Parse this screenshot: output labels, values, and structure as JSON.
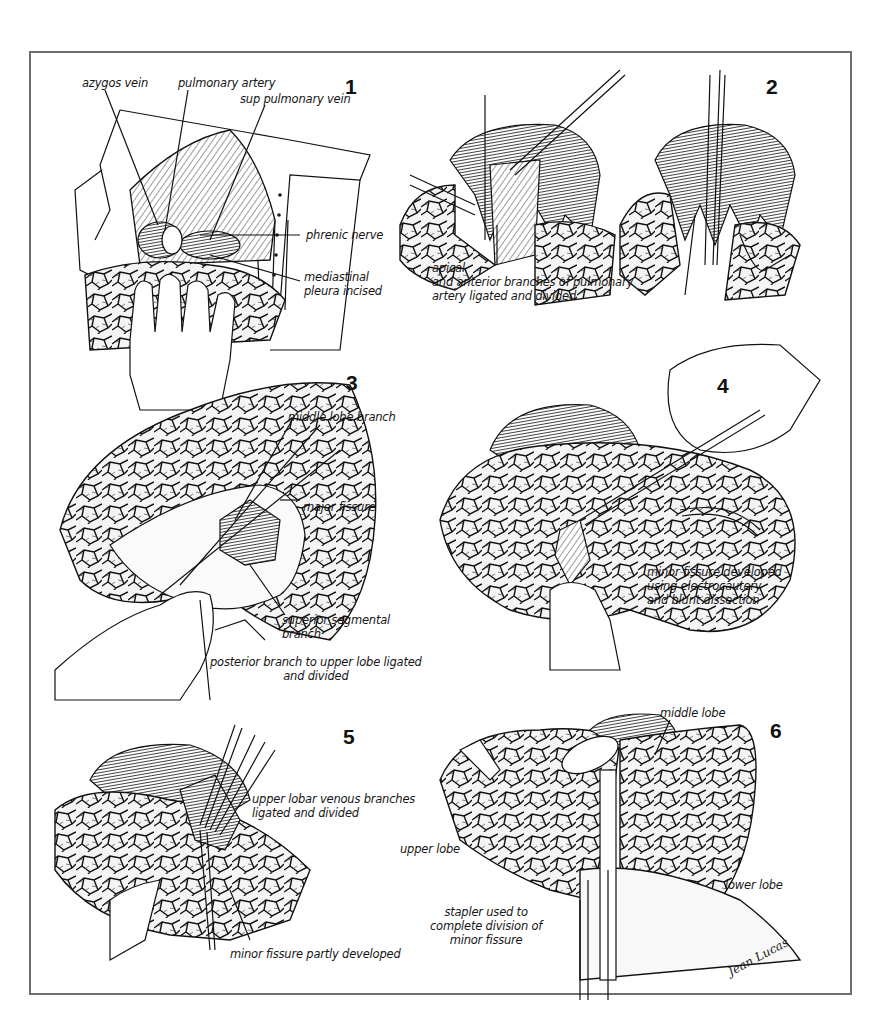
{
  "figure": {
    "panels": [
      {
        "number": "1",
        "labels": {
          "azygos_vein": "azygos vein",
          "pulmonary_artery": "pulmonary artery",
          "sup_pulmonary_vein": "sup pulmonary vein",
          "phrenic_nerve": "phrenic nerve",
          "mediastinal_pleura": "mediastinal\npleura  incised"
        }
      },
      {
        "number": "2",
        "labels": {
          "branches": "apical\nand anterior branches of pulmonary\n artery  ligated and divided"
        }
      },
      {
        "number": "3",
        "labels": {
          "middle_lobe_branch": "middle  lobe branch",
          "major_fissure": "major fissure",
          "superior_segmental_branch": "superior segmental branch",
          "posterior_branch": "posterior branch to upper lobe ligated\nand divided"
        }
      },
      {
        "number": "4",
        "labels": {
          "minor_fissure": "minor fissure developed\nusing  electrocautery\n and blunt dissection"
        }
      },
      {
        "number": "5",
        "labels": {
          "venous_branches": "upper lobar venous branches\nligated and divided",
          "minor_fissure_partly": "minor fissure  partly developed"
        }
      },
      {
        "number": "6",
        "labels": {
          "middle_lobe": "middle lobe",
          "upper_lobe": "upper lobe",
          "lower_lobe": "lower lobe",
          "stapler": "stapler used to\ncomplete division of\nminor fissure"
        },
        "signature": "Jean Lucas"
      }
    ]
  }
}
